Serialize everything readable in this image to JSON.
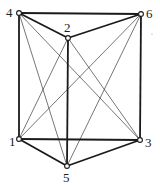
{
  "diagram": {
    "nodes": [
      {
        "id": "1",
        "label": "1",
        "x": 19,
        "y": 139,
        "lx": 9,
        "ly": 146
      },
      {
        "id": "2",
        "label": "2",
        "x": 68,
        "y": 38,
        "lx": 64,
        "ly": 32
      },
      {
        "id": "3",
        "label": "3",
        "x": 140,
        "y": 140,
        "lx": 145,
        "ly": 147
      },
      {
        "id": "4",
        "label": "4",
        "x": 19,
        "y": 13,
        "lx": 6,
        "ly": 17
      },
      {
        "id": "5",
        "label": "5",
        "x": 67,
        "y": 166,
        "lx": 63,
        "ly": 182
      },
      {
        "id": "6",
        "label": "6",
        "x": 141,
        "y": 14,
        "lx": 146,
        "ly": 18
      }
    ],
    "edges_thick": [
      [
        "4",
        "6"
      ],
      [
        "4",
        "2"
      ],
      [
        "2",
        "6"
      ],
      [
        "4",
        "1"
      ],
      [
        "6",
        "3"
      ],
      [
        "2",
        "5"
      ],
      [
        "1",
        "3"
      ],
      [
        "1",
        "5"
      ],
      [
        "5",
        "3"
      ]
    ],
    "edges_thin": [
      [
        "4",
        "5"
      ],
      [
        "4",
        "3"
      ],
      [
        "6",
        "1"
      ],
      [
        "6",
        "5"
      ],
      [
        "2",
        "1"
      ],
      [
        "2",
        "3"
      ]
    ],
    "colors": {
      "line": "#1a1a1a",
      "node_fill": "#ffffff"
    }
  }
}
